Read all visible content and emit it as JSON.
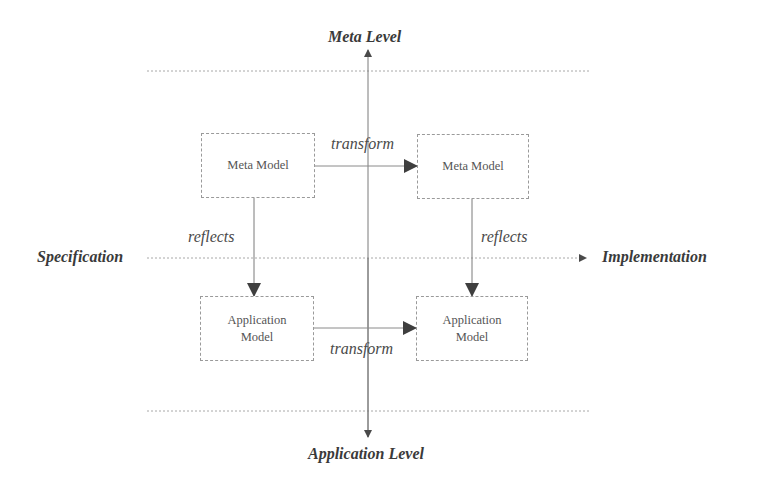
{
  "axes": {
    "top": "Meta Level",
    "bottom": "Application Level",
    "left": "Specification",
    "right": "Implementation"
  },
  "nodes": {
    "meta_spec": {
      "line1": "Meta Model",
      "line2": ""
    },
    "meta_impl": {
      "line1": "Meta Model",
      "line2": ""
    },
    "app_spec": {
      "line1": "Application",
      "line2": "Model"
    },
    "app_impl": {
      "line1": "Application",
      "line2": "Model"
    }
  },
  "edges": {
    "meta_transform": "transform",
    "app_transform": "transform",
    "spec_reflects": "reflects",
    "impl_reflects": "reflects"
  },
  "colors": {
    "line": "#7a7a7a",
    "dotted": "#a8a8a8",
    "arrowhead": "#4a4a4a",
    "text": "#3a3a3a"
  }
}
